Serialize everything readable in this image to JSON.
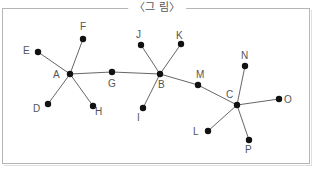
{
  "figure": {
    "caption": "〈그 림〉",
    "colors": {
      "edge": "#666666",
      "node": "#111111",
      "label": "#555555",
      "frame": "#b5b5b5"
    },
    "nodes": [
      {
        "id": "A",
        "x": 70,
        "y": 74,
        "lx": 53,
        "ly": 78
      },
      {
        "id": "B",
        "x": 160,
        "y": 74,
        "lx": 158,
        "ly": 88
      },
      {
        "id": "C",
        "x": 237,
        "y": 105,
        "lx": 226,
        "ly": 98
      },
      {
        "id": "D",
        "x": 48,
        "y": 104,
        "lx": 33,
        "ly": 112
      },
      {
        "id": "E",
        "x": 38,
        "y": 52,
        "lx": 23,
        "ly": 54
      },
      {
        "id": "F",
        "x": 83,
        "y": 39,
        "lx": 80,
        "ly": 30
      },
      {
        "id": "G",
        "x": 112,
        "y": 72,
        "lx": 108,
        "ly": 87
      },
      {
        "id": "H",
        "x": 93,
        "y": 106,
        "lx": 95,
        "ly": 115
      },
      {
        "id": "I",
        "x": 143,
        "y": 108,
        "lx": 137,
        "ly": 121
      },
      {
        "id": "J",
        "x": 141,
        "y": 45,
        "lx": 136,
        "ly": 38
      },
      {
        "id": "K",
        "x": 181,
        "y": 44,
        "lx": 176,
        "ly": 39
      },
      {
        "id": "L",
        "x": 208,
        "y": 131,
        "lx": 193,
        "ly": 135
      },
      {
        "id": "M",
        "x": 198,
        "y": 85,
        "lx": 196,
        "ly": 78
      },
      {
        "id": "N",
        "x": 245,
        "y": 66,
        "lx": 241,
        "ly": 59
      },
      {
        "id": "O",
        "x": 279,
        "y": 99,
        "lx": 284,
        "ly": 103
      },
      {
        "id": "P",
        "x": 249,
        "y": 140,
        "lx": 245,
        "ly": 153
      }
    ],
    "edges": [
      [
        "A",
        "E"
      ],
      [
        "A",
        "F"
      ],
      [
        "A",
        "D"
      ],
      [
        "A",
        "H"
      ],
      [
        "A",
        "G"
      ],
      [
        "G",
        "B"
      ],
      [
        "B",
        "J"
      ],
      [
        "B",
        "K"
      ],
      [
        "B",
        "I"
      ],
      [
        "B",
        "M"
      ],
      [
        "M",
        "C"
      ],
      [
        "C",
        "N"
      ],
      [
        "C",
        "O"
      ],
      [
        "C",
        "L"
      ],
      [
        "C",
        "P"
      ]
    ]
  }
}
